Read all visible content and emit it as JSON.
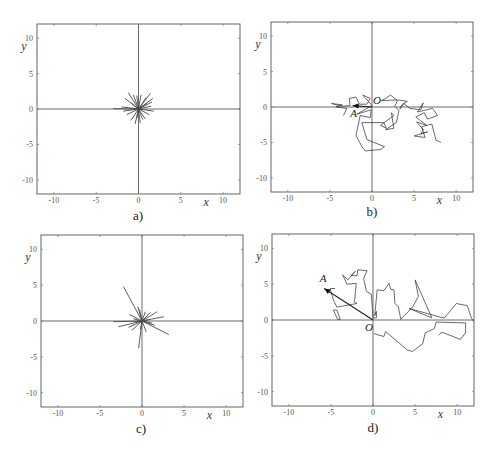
{
  "chart_data": [
    {
      "id": "a",
      "type": "line",
      "panel_label": "a)",
      "xlabel": "x",
      "ylabel": "y",
      "xlim": [
        -12,
        12
      ],
      "ylim": [
        -12,
        12
      ],
      "xticks": [
        -10,
        -5,
        0,
        5,
        10
      ],
      "yticks": [
        -10,
        -5,
        0,
        5,
        10
      ],
      "style": "star",
      "rays": [
        [
          -1.2,
          2.3
        ],
        [
          -0.6,
          2.0
        ],
        [
          -1.6,
          1.5
        ],
        [
          1.4,
          2.2
        ],
        [
          0.9,
          1.6
        ],
        [
          0.3,
          2.0
        ],
        [
          -0.2,
          1.9
        ],
        [
          1.6,
          1.0
        ],
        [
          1.5,
          0.4
        ],
        [
          -2.0,
          0.3
        ],
        [
          -3.0,
          0.05
        ],
        [
          -1.8,
          -0.3
        ],
        [
          1.8,
          -0.3
        ],
        [
          1.3,
          -0.8
        ],
        [
          0.8,
          -1.4
        ],
        [
          -0.9,
          -1.6
        ],
        [
          -0.4,
          -2.1
        ],
        [
          -0.2,
          -1.3
        ],
        [
          0.5,
          -1.5
        ],
        [
          -1.4,
          -0.8
        ],
        [
          1.0,
          0.8
        ],
        [
          -0.9,
          0.9
        ],
        [
          0.2,
          -2.0
        ],
        [
          1.7,
          1.5
        ]
      ]
    },
    {
      "id": "b",
      "type": "line",
      "panel_label": "b)",
      "xlabel": "x",
      "ylabel": "y",
      "xlim": [
        -12,
        12
      ],
      "ylim": [
        -12,
        12
      ],
      "xticks": [
        -10,
        -5,
        0,
        5,
        10
      ],
      "yticks": [
        -10,
        -5,
        0,
        5,
        10
      ],
      "style": "walk",
      "points": {
        "origin_label": "O",
        "end_label": "A",
        "A": [
          -2.3,
          0.2
        ]
      },
      "paths": [
        [
          [
            0,
            0.2
          ],
          [
            -1.1,
            1.7
          ],
          [
            -0.2,
            1.2
          ],
          [
            -0.6,
            0.4
          ],
          [
            -1.5,
            0.4
          ],
          [
            -1.9,
            1.4
          ],
          [
            -2.7,
            1.2
          ],
          [
            -2.6,
            0.2
          ],
          [
            -3.6,
            0.1
          ],
          [
            -4.8,
            0.5
          ],
          [
            -3.5,
            0.3
          ],
          [
            -4.3,
            0.0
          ],
          [
            -3.0,
            -0.2
          ],
          [
            -3.4,
            -1.2
          ]
        ],
        [
          [
            0,
            0.2
          ],
          [
            -1.8,
            -1.0
          ],
          [
            -0.1,
            -0.4
          ],
          [
            -0.2,
            -1.5
          ],
          [
            -1.4,
            -1.2
          ],
          [
            -1.9,
            -4.0
          ],
          [
            -1.2,
            -5.6
          ],
          [
            -0.8,
            -6.2
          ],
          [
            1.0,
            -6.0
          ],
          [
            1.5,
            -5.6
          ],
          [
            -0.6,
            -4.6
          ],
          [
            -1.2,
            -2.2
          ],
          [
            1.4,
            -2.2
          ],
          [
            1.7,
            -3.0
          ],
          [
            1.0,
            -2.6
          ],
          [
            2.6,
            -1.2
          ],
          [
            2.3,
            -0.8
          ],
          [
            2.6,
            -3.0
          ],
          [
            1.6,
            -3.2
          ],
          [
            2.9,
            -2.2
          ],
          [
            3.2,
            -0.5
          ],
          [
            2.7,
            0.1
          ],
          [
            3.0,
            0.9
          ],
          [
            2.2,
            1.7
          ],
          [
            1.6,
            1.2
          ],
          [
            1.1,
            0.9
          ],
          [
            3.0,
            1.0
          ],
          [
            4.2,
            0.8
          ],
          [
            3.6,
            0.4
          ],
          [
            3.3,
            -0.3
          ],
          [
            3.8,
            0.5
          ],
          [
            4.5,
            -0.2
          ],
          [
            5.8,
            -0.4
          ],
          [
            6.1,
            0.6
          ],
          [
            5.4,
            -0.7
          ],
          [
            7.2,
            -0.2
          ],
          [
            7.8,
            -1.2
          ],
          [
            6.6,
            -1.7
          ],
          [
            6.2,
            -0.8
          ],
          [
            5.2,
            -1.4
          ],
          [
            6.5,
            -2.6
          ],
          [
            5.3,
            -2.1
          ],
          [
            6.1,
            -3.2
          ],
          [
            5.8,
            -3.8
          ],
          [
            6.6,
            -3.5
          ],
          [
            5.0,
            -4.1
          ],
          [
            6.3,
            -4.3
          ],
          [
            5.9,
            -2.8
          ],
          [
            7.1,
            -2.4
          ],
          [
            7.6,
            -4.7
          ],
          [
            8.2,
            -5.0
          ]
        ]
      ]
    },
    {
      "id": "c",
      "type": "line",
      "panel_label": "c)",
      "xlabel": "x",
      "ylabel": "y",
      "xlim": [
        -12,
        12
      ],
      "ylim": [
        -12,
        12
      ],
      "xticks": [
        -10,
        -5,
        0,
        5,
        10
      ],
      "yticks": [
        -10,
        -5,
        0,
        5,
        10
      ],
      "style": "star",
      "rays": [
        [
          -2.2,
          4.8
        ],
        [
          -0.5,
          2.0
        ],
        [
          -0.3,
          1.6
        ],
        [
          0.4,
          1.3
        ],
        [
          1.0,
          1.2
        ],
        [
          1.8,
          1.3
        ],
        [
          2.6,
          0.6
        ],
        [
          -1.5,
          0.9
        ],
        [
          -3.4,
          -0.1
        ],
        [
          -2.8,
          -0.8
        ],
        [
          -1.6,
          -0.9
        ],
        [
          -1.2,
          -1.3
        ],
        [
          3.2,
          -1.9
        ],
        [
          1.5,
          -0.6
        ],
        [
          0.5,
          -1.5
        ],
        [
          -0.4,
          -3.8
        ],
        [
          -0.2,
          -1.2
        ],
        [
          0.9,
          0.2
        ],
        [
          -0.8,
          -0.1
        ],
        [
          1.2,
          -0.3
        ],
        [
          0.7,
          0.8
        ],
        [
          -1.0,
          0.3
        ]
      ]
    },
    {
      "id": "d",
      "type": "line",
      "panel_label": "d)",
      "xlabel": "x",
      "ylabel": "y",
      "xlim": [
        -12,
        12
      ],
      "ylim": [
        -12,
        12
      ],
      "xticks": [
        -10,
        -5,
        0,
        5,
        10
      ],
      "yticks": [
        -10,
        -5,
        0,
        5,
        10
      ],
      "style": "walk",
      "points": {
        "origin_label": "O",
        "end_label": "A",
        "A": [
          -5.8,
          4.4
        ]
      },
      "paths": [
        [
          [
            0,
            0.3
          ],
          [
            -0.2,
            3.6
          ],
          [
            -0.8,
            4.0
          ],
          [
            -1.1,
            5.8
          ],
          [
            -0.7,
            6.9
          ],
          [
            -1.8,
            7.0
          ],
          [
            -1.9,
            6.2
          ],
          [
            -2.6,
            6.2
          ],
          [
            -2.1,
            6.8
          ],
          [
            -3.0,
            5.6
          ],
          [
            -3.6,
            6.3
          ],
          [
            -3.1,
            5.0
          ],
          [
            -2.0,
            5.1
          ],
          [
            -2.2,
            2.5
          ],
          [
            -1.9,
            2.3
          ],
          [
            -4.3,
            1.8
          ],
          [
            -4.7,
            2.8
          ],
          [
            -5.1,
            4.4
          ],
          [
            -4.5,
            4.4
          ]
        ],
        [
          [
            -3.9,
            0.1
          ],
          [
            -4.3,
            1.4
          ],
          [
            -4.7,
            1.4
          ],
          [
            -4.2,
            0.1
          ],
          [
            -3.9,
            0.1
          ]
        ],
        [
          [
            0,
            0.3
          ],
          [
            0.4,
            0.3
          ],
          [
            0.4,
            1.2
          ],
          [
            0.2,
            0.6
          ],
          [
            0.5,
            4.2
          ],
          [
            1.3,
            4.1
          ],
          [
            1.9,
            5.1
          ],
          [
            2.1,
            4.3
          ],
          [
            2.5,
            4.2
          ],
          [
            2.6,
            2.3
          ],
          [
            3.0,
            1.9
          ],
          [
            3.3,
            0.1
          ],
          [
            4.7,
            1.8
          ],
          [
            5.4,
            3.3
          ],
          [
            5.0,
            5.6
          ],
          [
            7.0,
            0.3
          ],
          [
            4.3,
            1.6
          ],
          [
            8.0,
            0.4
          ],
          [
            8.5,
            0.3
          ],
          [
            9.9,
            2.3
          ],
          [
            11.2,
            2.0
          ],
          [
            11.7,
            0.2
          ],
          [
            12,
            -0.2
          ]
        ],
        [
          [
            0.1,
            -1.9
          ],
          [
            1.3,
            -2.3
          ],
          [
            1.5,
            -1.6
          ],
          [
            4.1,
            -4.2
          ],
          [
            4.7,
            -4.4
          ],
          [
            5.9,
            -3.3
          ],
          [
            6.2,
            -1.8
          ],
          [
            7.3,
            -1.2
          ],
          [
            7.5,
            -0.3
          ],
          [
            11.0,
            -0.4
          ],
          [
            11.0,
            -1.8
          ],
          [
            10.4,
            -2.7
          ],
          [
            9.3,
            -2.2
          ],
          [
            8.2,
            -1.7
          ],
          [
            7.8,
            -2.1
          ]
        ]
      ]
    }
  ]
}
